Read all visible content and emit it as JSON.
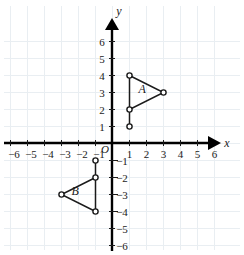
{
  "figure": {
    "type": "coordinate-plane",
    "background_color": "#ffffff",
    "ink_color": "#1a1a1a",
    "grid_color": "#e9eef2"
  },
  "chart_data": {
    "type": "scatter",
    "title": "",
    "xlabel": "x",
    "ylabel": "y",
    "xlim": [
      -6.8,
      6.8
    ],
    "ylim": [
      -6.8,
      6.8
    ],
    "grid": true,
    "legend": "none",
    "origin_label": "O",
    "x_ticks": [
      -6,
      -5,
      -4,
      -3,
      -2,
      -1,
      1,
      2,
      3,
      4,
      5,
      6
    ],
    "y_ticks": [
      6,
      5,
      4,
      3,
      2,
      1,
      -1,
      -2,
      -3,
      -4,
      -5,
      -6
    ],
    "x_tick_labels": [
      "−6",
      "−5",
      "−4",
      "−3",
      "−2",
      "−1",
      "1",
      "2",
      "3",
      "4",
      "5",
      "6"
    ],
    "y_tick_labels_positive": [
      "6",
      "5",
      "4",
      "3",
      "2",
      "1"
    ],
    "y_tick_labels_negative": [
      "−1",
      "−2",
      "−3",
      "−4",
      "−5",
      "−6"
    ],
    "series": [
      {
        "name": "A",
        "label": "A",
        "label_position": [
          1.75,
          2.95
        ],
        "shape": "triangle",
        "closed": true,
        "vertices": [
          [
            1,
            4
          ],
          [
            3,
            3
          ],
          [
            1,
            2
          ]
        ],
        "extra_points": [
          [
            1,
            1
          ]
        ],
        "extra_segments": [
          [
            [
              1,
              2
            ],
            [
              1,
              1
            ]
          ]
        ]
      },
      {
        "name": "B",
        "label": "B",
        "label_position": [
          -2.2,
          -3.05
        ],
        "shape": "triangle",
        "closed": true,
        "vertices": [
          [
            -1,
            -2
          ],
          [
            -3,
            -3
          ],
          [
            -1,
            -4
          ]
        ],
        "extra_points": [
          [
            -1,
            -1
          ]
        ],
        "extra_segments": [
          [
            [
              -1,
              -2
            ],
            [
              -1,
              -1
            ]
          ]
        ]
      }
    ]
  },
  "axes": {
    "x_axis_name": "x",
    "y_axis_name": "y"
  }
}
